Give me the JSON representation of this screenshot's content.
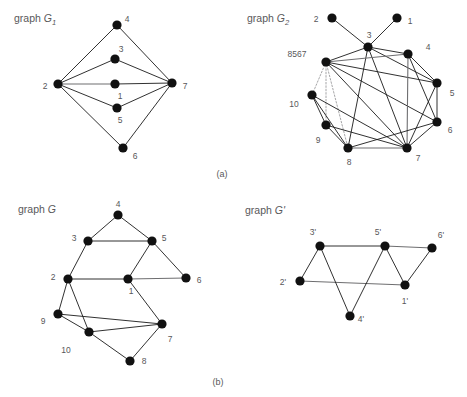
{
  "figure": {
    "width": 467,
    "height": 397,
    "background": "#ffffff",
    "node_color": "#111111",
    "edge_color": "#1a1a1a",
    "edge_grey_color": "#6e6e70",
    "edge_dotted_color": "#9b9b9d",
    "label_color": "#58585a"
  },
  "panels": [
    {
      "caption": "(a)",
      "caption_pos": {
        "x": 222,
        "y": 177
      },
      "graphs": [
        "g1",
        "g2"
      ]
    },
    {
      "caption": "(b)",
      "caption_pos": {
        "x": 218,
        "y": 385
      },
      "graphs": [
        "g",
        "gprime"
      ]
    }
  ],
  "graphs": {
    "g1": {
      "title_prefix": "graph ",
      "title_name": "G",
      "title_sub": "1",
      "title_pos": {
        "x": 14,
        "y": 22
      },
      "nodes": [
        {
          "id": "2",
          "label": "2",
          "x": 58,
          "y": 84,
          "r": 4.6,
          "lx": 45,
          "ly": 87
        },
        {
          "id": "4",
          "label": "4",
          "x": 117,
          "y": 25,
          "r": 4.6,
          "lx": 127,
          "ly": 20
        },
        {
          "id": "3",
          "label": "3",
          "x": 115,
          "y": 59,
          "r": 4.6,
          "lx": 121,
          "ly": 50
        },
        {
          "id": "1",
          "label": "1",
          "x": 115,
          "y": 84,
          "r": 4.6,
          "lx": 120,
          "ly": 97
        },
        {
          "id": "5",
          "label": "5",
          "x": 117,
          "y": 108,
          "r": 4.6,
          "lx": 120,
          "ly": 121
        },
        {
          "id": "6",
          "label": "6",
          "x": 123,
          "y": 148,
          "r": 4.6,
          "lx": 135,
          "ly": 157
        },
        {
          "id": "7",
          "label": "7",
          "x": 172,
          "y": 83,
          "r": 4.6,
          "lx": 185,
          "ly": 87
        }
      ],
      "edges": [
        {
          "from": "2",
          "to": "4",
          "style": "solid"
        },
        {
          "from": "2",
          "to": "3",
          "style": "solid"
        },
        {
          "from": "2",
          "to": "1",
          "style": "grey"
        },
        {
          "from": "2",
          "to": "5",
          "style": "solid"
        },
        {
          "from": "2",
          "to": "6",
          "style": "solid"
        },
        {
          "from": "4",
          "to": "7",
          "style": "solid"
        },
        {
          "from": "3",
          "to": "7",
          "style": "solid"
        },
        {
          "from": "1",
          "to": "7",
          "style": "solid"
        },
        {
          "from": "5",
          "to": "7",
          "style": "solid"
        },
        {
          "from": "6",
          "to": "7",
          "style": "solid"
        }
      ]
    },
    "g2": {
      "title_prefix": "graph ",
      "title_name": "G",
      "title_sub": "2",
      "title_pos": {
        "x": 247,
        "y": 22
      },
      "nodes": [
        {
          "id": "2",
          "label": "2",
          "x": 332,
          "y": 18,
          "r": 4.6,
          "lx": 316,
          "ly": 20
        },
        {
          "id": "1",
          "label": "1",
          "x": 397,
          "y": 18,
          "r": 4.6,
          "lx": 410,
          "ly": 22
        },
        {
          "id": "3",
          "label": "3",
          "x": 368,
          "y": 47,
          "r": 4.6,
          "lx": 369,
          "ly": 36
        },
        {
          "id": "8567",
          "label": "8567",
          "x": 326,
          "y": 62,
          "r": 4.6,
          "lx": 297,
          "ly": 55
        },
        {
          "id": "4",
          "label": "4",
          "x": 408,
          "y": 54,
          "r": 4.6,
          "lx": 428,
          "ly": 48
        },
        {
          "id": "5",
          "label": "5",
          "x": 437,
          "y": 83,
          "r": 4.6,
          "lx": 452,
          "ly": 94
        },
        {
          "id": "6",
          "label": "6",
          "x": 437,
          "y": 122,
          "r": 4.6,
          "lx": 450,
          "ly": 131
        },
        {
          "id": "10",
          "label": "10",
          "x": 312,
          "y": 95,
          "r": 4.6,
          "lx": 294,
          "ly": 105
        },
        {
          "id": "9",
          "label": "9",
          "x": 326,
          "y": 125,
          "r": 4.6,
          "lx": 318,
          "ly": 141
        },
        {
          "id": "8",
          "label": "8",
          "x": 348,
          "y": 148,
          "r": 4.6,
          "lx": 349,
          "ly": 163
        },
        {
          "id": "7",
          "label": "7",
          "x": 407,
          "y": 148,
          "r": 4.6,
          "lx": 418,
          "ly": 159
        }
      ],
      "edges": [
        {
          "from": "2",
          "to": "3",
          "style": "solid"
        },
        {
          "from": "1",
          "to": "3",
          "style": "solid"
        },
        {
          "from": "3",
          "to": "8567",
          "style": "solid"
        },
        {
          "from": "3",
          "to": "4",
          "style": "solid"
        },
        {
          "from": "3",
          "to": "5",
          "style": "solid"
        },
        {
          "from": "3",
          "to": "7",
          "style": "solid"
        },
        {
          "from": "3",
          "to": "8",
          "style": "solid"
        },
        {
          "from": "8567",
          "to": "4",
          "style": "grey"
        },
        {
          "from": "8567",
          "to": "5",
          "style": "solid"
        },
        {
          "from": "8567",
          "to": "6",
          "style": "solid"
        },
        {
          "from": "8567",
          "to": "7",
          "style": "solid"
        },
        {
          "from": "8567",
          "to": "10",
          "style": "dotted"
        },
        {
          "from": "8567",
          "to": "9",
          "style": "dotted"
        },
        {
          "from": "8567",
          "to": "8",
          "style": "dotted"
        },
        {
          "from": "4",
          "to": "5",
          "style": "solid"
        },
        {
          "from": "4",
          "to": "6",
          "style": "solid"
        },
        {
          "from": "4",
          "to": "7",
          "style": "grey"
        },
        {
          "from": "5",
          "to": "6",
          "style": "solid"
        },
        {
          "from": "5",
          "to": "7",
          "style": "solid"
        },
        {
          "from": "6",
          "to": "7",
          "style": "solid"
        },
        {
          "from": "6",
          "to": "8",
          "style": "solid"
        },
        {
          "from": "10",
          "to": "9",
          "style": "solid"
        },
        {
          "from": "10",
          "to": "8",
          "style": "solid"
        },
        {
          "from": "10",
          "to": "7",
          "style": "solid"
        },
        {
          "from": "9",
          "to": "8",
          "style": "solid"
        },
        {
          "from": "9",
          "to": "7",
          "style": "solid"
        },
        {
          "from": "8",
          "to": "7",
          "style": "grey"
        }
      ]
    },
    "g": {
      "title_prefix": "graph ",
      "title_name": "G",
      "title_sub": "",
      "title_pos": {
        "x": 18,
        "y": 213
      },
      "nodes": [
        {
          "id": "4",
          "label": "4",
          "x": 118,
          "y": 215,
          "r": 4.6,
          "lx": 118,
          "ly": 205
        },
        {
          "id": "3",
          "label": "3",
          "x": 88,
          "y": 241,
          "r": 4.6,
          "lx": 74,
          "ly": 239
        },
        {
          "id": "5",
          "label": "5",
          "x": 152,
          "y": 241,
          "r": 4.6,
          "lx": 164,
          "ly": 239
        },
        {
          "id": "2",
          "label": "2",
          "x": 68,
          "y": 279,
          "r": 4.6,
          "lx": 53,
          "ly": 278
        },
        {
          "id": "1",
          "label": "1",
          "x": 128,
          "y": 279,
          "r": 4.6,
          "lx": 131,
          "ly": 292
        },
        {
          "id": "6",
          "label": "6",
          "x": 186,
          "y": 278,
          "r": 4.6,
          "lx": 199,
          "ly": 281
        },
        {
          "id": "9",
          "label": "9",
          "x": 58,
          "y": 314,
          "r": 4.6,
          "lx": 43,
          "ly": 322
        },
        {
          "id": "10",
          "label": "10",
          "x": 89,
          "y": 332,
          "r": 4.6,
          "lx": 66,
          "ly": 351
        },
        {
          "id": "7",
          "label": "7",
          "x": 162,
          "y": 324,
          "r": 4.6,
          "lx": 170,
          "ly": 340
        },
        {
          "id": "8",
          "label": "8",
          "x": 130,
          "y": 361,
          "r": 4.6,
          "lx": 144,
          "ly": 362
        }
      ],
      "edges": [
        {
          "from": "4",
          "to": "3",
          "style": "solid"
        },
        {
          "from": "4",
          "to": "5",
          "style": "solid"
        },
        {
          "from": "3",
          "to": "5",
          "style": "solid"
        },
        {
          "from": "3",
          "to": "2",
          "style": "solid"
        },
        {
          "from": "5",
          "to": "1",
          "style": "solid"
        },
        {
          "from": "5",
          "to": "6",
          "style": "solid"
        },
        {
          "from": "2",
          "to": "1",
          "style": "solid"
        },
        {
          "from": "1",
          "to": "6",
          "style": "grey"
        },
        {
          "from": "2",
          "to": "9",
          "style": "solid"
        },
        {
          "from": "2",
          "to": "10",
          "style": "solid"
        },
        {
          "from": "1",
          "to": "7",
          "style": "solid"
        },
        {
          "from": "9",
          "to": "10",
          "style": "solid"
        },
        {
          "from": "9",
          "to": "7",
          "style": "solid"
        },
        {
          "from": "10",
          "to": "7",
          "style": "solid"
        },
        {
          "from": "10",
          "to": "8",
          "style": "solid"
        },
        {
          "from": "8",
          "to": "7",
          "style": "solid"
        }
      ]
    },
    "gprime": {
      "title_prefix": "graph ",
      "title_name": "G'",
      "title_sub": "",
      "title_pos": {
        "x": 245,
        "y": 214
      },
      "nodes": [
        {
          "id": "3p",
          "label": "3'",
          "x": 320,
          "y": 246,
          "r": 4.6,
          "lx": 313,
          "ly": 233
        },
        {
          "id": "5p",
          "label": "5'",
          "x": 385,
          "y": 246,
          "r": 4.6,
          "lx": 378,
          "ly": 233
        },
        {
          "id": "6p",
          "label": "6'",
          "x": 432,
          "y": 248,
          "r": 4.6,
          "lx": 441,
          "ly": 236
        },
        {
          "id": "2p",
          "label": "2'",
          "x": 300,
          "y": 281,
          "r": 4.6,
          "lx": 283,
          "ly": 283
        },
        {
          "id": "1p",
          "label": "1'",
          "x": 405,
          "y": 285,
          "r": 4.6,
          "lx": 405,
          "ly": 302
        },
        {
          "id": "4p",
          "label": "4'",
          "x": 350,
          "y": 316,
          "r": 4.6,
          "lx": 361,
          "ly": 320
        }
      ],
      "edges": [
        {
          "from": "3p",
          "to": "5p",
          "style": "solid"
        },
        {
          "from": "5p",
          "to": "6p",
          "style": "grey"
        },
        {
          "from": "3p",
          "to": "2p",
          "style": "solid"
        },
        {
          "from": "2p",
          "to": "1p",
          "style": "grey"
        },
        {
          "from": "5p",
          "to": "1p",
          "style": "solid"
        },
        {
          "from": "6p",
          "to": "1p",
          "style": "solid"
        },
        {
          "from": "3p",
          "to": "4p",
          "style": "solid"
        },
        {
          "from": "5p",
          "to": "4p",
          "style": "solid"
        }
      ]
    }
  }
}
